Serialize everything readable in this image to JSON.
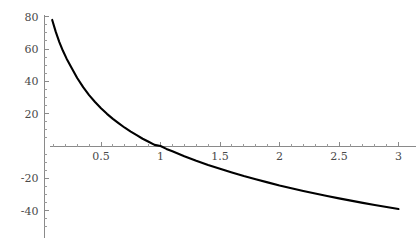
{
  "chart_data": {
    "type": "line",
    "title": "",
    "subtitle": "",
    "xlabel": "",
    "ylabel": "",
    "xlim": [
      0.08,
      3.1
    ],
    "ylim": [
      -56,
      80
    ],
    "grid": false,
    "legend": null,
    "x_ticks": [
      0.5,
      1,
      1.5,
      2,
      2.5,
      3
    ],
    "x_tick_labels": [
      "0.5",
      "1",
      "1.5",
      "2",
      "2.5",
      "3"
    ],
    "x_minor_ticks": [
      0.1,
      0.2,
      0.3,
      0.4,
      0.6,
      0.7,
      0.8,
      0.9,
      1.1,
      1.2,
      1.3,
      1.4,
      1.6,
      1.7,
      1.8,
      1.9,
      2.1,
      2.2,
      2.3,
      2.4,
      2.6,
      2.7,
      2.8,
      2.9,
      3.0
    ],
    "y_ticks": [
      -40,
      -20,
      20,
      40,
      60,
      80
    ],
    "y_tick_labels": [
      "-40",
      "-20",
      "20",
      "40",
      "60",
      "80"
    ],
    "y_minor_ticks": [
      -50,
      -45,
      -35,
      -30,
      -25,
      -15,
      -10,
      -5,
      5,
      10,
      15,
      25,
      30,
      35,
      45,
      50,
      55,
      65,
      70,
      75
    ],
    "axis_color": "#8a8a8a",
    "curve_color": "#000000",
    "background_color": "#ffffff",
    "series": [
      {
        "name": "curve",
        "x": [
          0.09,
          0.12,
          0.15,
          0.18,
          0.21,
          0.25,
          0.3,
          0.35,
          0.4,
          0.45,
          0.5,
          0.55,
          0.6,
          0.65,
          0.7,
          0.75,
          0.8,
          0.85,
          0.9,
          0.95,
          1.0,
          1.05,
          1.1,
          1.2,
          1.3,
          1.4,
          1.5,
          1.6,
          1.7,
          1.8,
          1.9,
          2.0,
          2.1,
          2.2,
          2.3,
          2.4,
          2.5,
          2.6,
          2.7,
          2.8,
          2.9,
          3.0
        ],
        "y": [
          78.0,
          70.6,
          64.3,
          58.9,
          54.2,
          48.8,
          42.1,
          36.4,
          31.5,
          27.2,
          23.4,
          19.9,
          16.8,
          14.0,
          11.3,
          8.9,
          6.7,
          4.5,
          2.6,
          0.7,
          0.0,
          -1.8,
          -3.3,
          -6.3,
          -9.1,
          -11.7,
          -14.1,
          -16.4,
          -18.6,
          -20.6,
          -22.5,
          -24.4,
          -26.1,
          -27.8,
          -29.4,
          -30.9,
          -32.4,
          -33.8,
          -35.2,
          -36.5,
          -37.8,
          -39.0
        ]
      }
    ]
  },
  "axes": {
    "x_axis_name": "x-axis",
    "y_axis_name": "y-axis"
  }
}
